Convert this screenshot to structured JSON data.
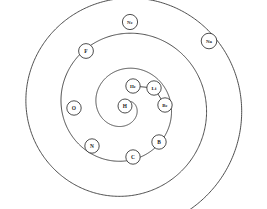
{
  "figure": {
    "background_color": "#ffffff",
    "stroke_color": "#3a3a3a",
    "label_color": "#1e1e1e",
    "node_fill": "#ffffff"
  },
  "chart_data": {
    "type": "scatter",
    "subtitle": "",
    "xlabel": "",
    "ylabel": "",
    "xlim": [
      0,
      267
    ],
    "ylim": [
      0,
      209
    ],
    "grid": false,
    "legend": "none",
    "coordinate_system": "archimedean-spiral",
    "spiral_center": [
      125,
      106
    ],
    "series": [
      {
        "name": "elements",
        "points": [
          {
            "label": "H",
            "atomic_number": 1,
            "x": 125,
            "y": 106,
            "r": 7.0,
            "turn": 0
          },
          {
            "label": "He",
            "atomic_number": 2,
            "x": 133,
            "y": 86,
            "r": 7.2,
            "turn": 1
          },
          {
            "label": "Li",
            "atomic_number": 3,
            "x": 154,
            "y": 88,
            "r": 7.2,
            "turn": 1
          },
          {
            "label": "Be",
            "atomic_number": 4,
            "x": 165,
            "y": 105,
            "r": 7.2,
            "turn": 1
          },
          {
            "label": "B",
            "atomic_number": 5,
            "x": 159,
            "y": 142,
            "r": 7.2,
            "turn": 2
          },
          {
            "label": "C",
            "atomic_number": 6,
            "x": 133,
            "y": 157,
            "r": 7.2,
            "turn": 2
          },
          {
            "label": "N",
            "atomic_number": 7,
            "x": 92,
            "y": 146,
            "r": 7.2,
            "turn": 2
          },
          {
            "label": "O",
            "atomic_number": 8,
            "x": 74,
            "y": 108,
            "r": 7.2,
            "turn": 2
          },
          {
            "label": "F",
            "atomic_number": 9,
            "x": 86,
            "y": 51,
            "r": 7.4,
            "turn": 3
          },
          {
            "label": "Ne",
            "atomic_number": 10,
            "x": 130,
            "y": 22,
            "r": 7.6,
            "turn": 3
          },
          {
            "label": "Na",
            "atomic_number": 11,
            "x": 209,
            "y": 41,
            "r": 7.8,
            "turn": 3
          }
        ]
      }
    ],
    "annotations": [
      {
        "kind": "spiral-curve",
        "description": "continuous inward Archimedean spiral of about 3.5 turns"
      },
      {
        "kind": "connector",
        "description": "short chord linking He to Li"
      },
      {
        "kind": "connector",
        "description": "short chord linking Li to Be"
      },
      {
        "kind": "open-end",
        "description": "outer spiral arm terminates unclosed at lower left"
      },
      {
        "kind": "open-end",
        "description": "outer spiral arm terminates unclosed at right"
      }
    ]
  },
  "nodes": [
    {
      "symbol": "H"
    },
    {
      "symbol": "He"
    },
    {
      "symbol": "Li"
    },
    {
      "symbol": "Be"
    },
    {
      "symbol": "B"
    },
    {
      "symbol": "C"
    },
    {
      "symbol": "N"
    },
    {
      "symbol": "O"
    },
    {
      "symbol": "F"
    },
    {
      "symbol": "Ne"
    },
    {
      "symbol": "Na"
    }
  ]
}
